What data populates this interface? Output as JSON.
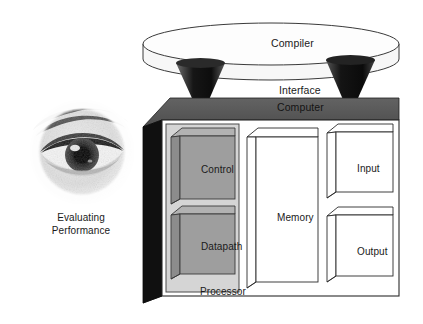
{
  "figure": {
    "compiler_label": "Compiler",
    "interface_label": "Interface",
    "computer_label": "Computer",
    "processor_label": "Processor",
    "control_label": "Control",
    "datapath_label": "Datapath",
    "memory_label": "Memory",
    "input_label": "Input",
    "output_label": "Output",
    "eval_line1": "Evaluating",
    "eval_line2": "Performance",
    "photo_caption": "human-eye-photograph"
  },
  "colors": {
    "page_background": "#ffffff",
    "outline": "#2b2b2b",
    "compiler_fill": "#fcfcfc",
    "compiler_side_fill": "#f2f2f2",
    "computer_top_face": "#585858",
    "computer_left_face": "#121212",
    "computer_body_fill": "#ffffff",
    "processor_panel_fill": "#d6d6d6",
    "cube_gray_front": "#9e9e9e",
    "cube_gray_top": "#b4b4b4",
    "cube_gray_side": "#8a8a8a",
    "cube_white_fill": "#ffffff",
    "cone_dark": "#1d1d1d",
    "text": "#1a1a1a"
  },
  "icons": {
    "compiler": "cylinder-disk-icon",
    "computer": "3d-box-icon",
    "control": "gray-cube-icon",
    "datapath": "gray-cube-icon",
    "memory": "tall-white-box-icon",
    "input": "white-cube-icon",
    "output": "white-cube-icon",
    "eye": "eye-photo-icon",
    "connector_left": "dark-cone-icon",
    "connector_right": "dark-cone-icon"
  }
}
